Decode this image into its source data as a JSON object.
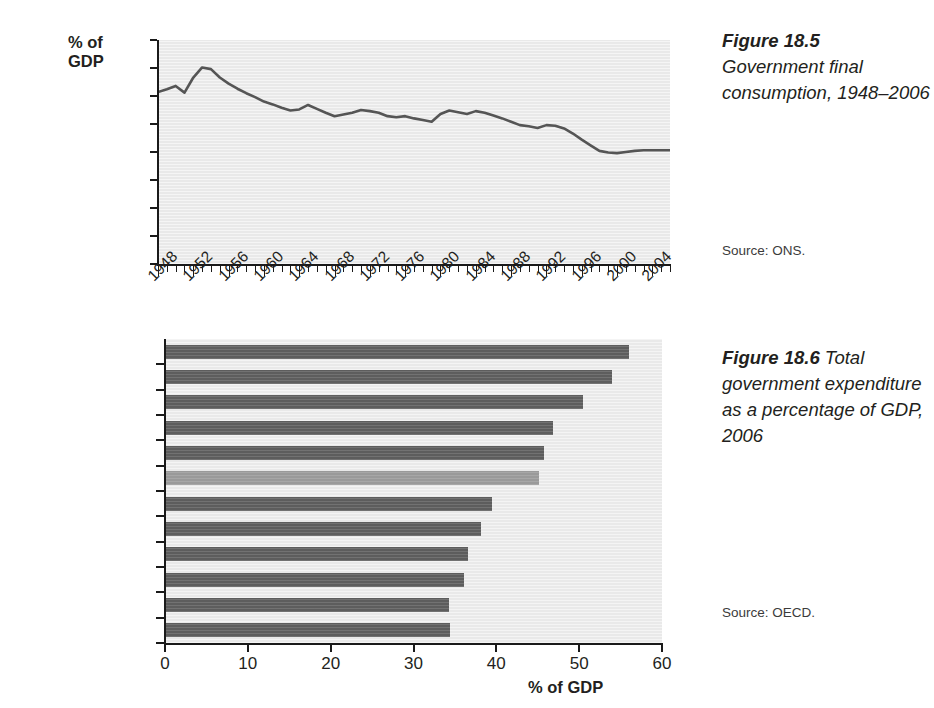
{
  "figure_185": {
    "caption_label": "Figure 18.5",
    "caption_text": "Government final consumption, 1948–2006",
    "source": "Source: ONS.",
    "y_axis_title_line1": "% of",
    "y_axis_title_line2": "GDP"
  },
  "figure_186": {
    "caption_label": "Figure 18.6",
    "caption_text": "Total government expenditure as a percentage of GDP, 2006",
    "source": "Source: OECD.",
    "x_axis_title": "% of GDP"
  },
  "chart_data": [
    {
      "type": "line",
      "title": "Government final consumption, 1948–2006",
      "xlabel": "",
      "ylabel": "% of GDP",
      "ylim": [
        0,
        40
      ],
      "yticks": [
        0,
        5,
        10,
        15,
        20,
        25,
        30,
        35,
        40
      ],
      "xlim": [
        1948,
        2006
      ],
      "xticks": [
        1948,
        1952,
        1956,
        1960,
        1964,
        1968,
        1972,
        1976,
        1980,
        1984,
        1988,
        1992,
        1996,
        2000,
        2004
      ],
      "xtick_labels": [
        "1948",
        "1952",
        "1956",
        "1960",
        "1964",
        "1968",
        "1972",
        "1976",
        "1980",
        "1984",
        "1988",
        "1992",
        "1996",
        "2000",
        "2004"
      ],
      "minor_xticks_every": 1,
      "grid": false,
      "legend": "none",
      "line_color": "#555555",
      "plot_background": "#e9e9e9",
      "source": "ONS",
      "x": [
        1948,
        1949,
        1950,
        1951,
        1952,
        1953,
        1954,
        1955,
        1956,
        1957,
        1958,
        1959,
        1960,
        1961,
        1962,
        1963,
        1964,
        1965,
        1966,
        1967,
        1968,
        1969,
        1970,
        1971,
        1972,
        1973,
        1974,
        1975,
        1976,
        1977,
        1978,
        1979,
        1980,
        1981,
        1982,
        1983,
        1984,
        1985,
        1986,
        1987,
        1988,
        1989,
        1990,
        1991,
        1992,
        1993,
        1994,
        1995,
        1996,
        1997,
        1998,
        1999,
        2000,
        2001,
        2002,
        2003,
        2004,
        2005,
        2006
      ],
      "y": [
        30.7,
        31.2,
        31.8,
        30.6,
        33.3,
        35.1,
        34.8,
        33.3,
        32.2,
        31.3,
        30.5,
        29.8,
        29.0,
        28.5,
        27.9,
        27.4,
        27.6,
        28.4,
        27.7,
        27.0,
        26.4,
        26.7,
        27.0,
        27.5,
        27.3,
        27.0,
        26.4,
        26.2,
        26.4,
        26.0,
        25.7,
        25.4,
        26.8,
        27.4,
        27.1,
        26.8,
        27.3,
        27.0,
        26.5,
        26.0,
        25.4,
        24.8,
        24.6,
        24.3,
        24.8,
        24.7,
        24.2,
        23.3,
        22.2,
        21.2,
        20.2,
        19.9,
        19.8,
        20.0,
        20.2,
        20.3,
        20.3,
        20.3,
        20.3
      ]
    },
    {
      "type": "bar",
      "orientation": "horizontal",
      "title": "Total government expenditure as a percentage of GDP, 2006",
      "xlabel": "% of GDP",
      "ylabel": "",
      "xlim": [
        0,
        60
      ],
      "xticks": [
        0,
        10,
        20,
        30,
        40,
        50,
        60
      ],
      "xtick_labels": [
        "0",
        "10",
        "20",
        "30",
        "40",
        "50",
        "60"
      ],
      "grid": false,
      "legend": "none",
      "bar_color": "#5d5d5d",
      "highlight_color": "#9a9a9a",
      "highlight_category": "UK",
      "plot_background": "#e9e9e9",
      "source": "OECD",
      "categories": [
        "Sweden",
        "France",
        "Italy",
        "Netherlands",
        "Germany",
        "UK",
        "Canada",
        "Japan",
        "USA",
        "Switzerland",
        "Ireland",
        "Australia"
      ],
      "values": [
        56.0,
        53.9,
        50.4,
        46.8,
        45.7,
        45.2,
        39.5,
        38.2,
        36.6,
        36.1,
        34.3,
        34.4
      ]
    }
  ]
}
